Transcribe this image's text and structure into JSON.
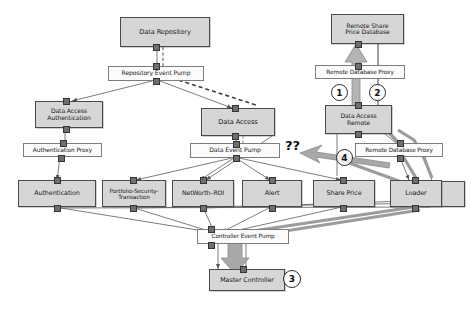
{
  "diagram": {
    "background_color": "#ffffff",
    "shaded_fill": "#d6d6d6",
    "plain_fill": "#fbfbfb",
    "thick_arrow_color": "#9a9a9a",
    "nodes": [
      {
        "id": "data-repository",
        "label": "Data Repository",
        "style": "shaded",
        "x": 120,
        "y": 17,
        "w": 90,
        "h": 30,
        "font": 6.6
      },
      {
        "id": "repository-event-pump",
        "label": "Repository Event Pump",
        "style": "plain",
        "x": 108,
        "y": 66,
        "w": 96,
        "h": 15,
        "font": 6.1
      },
      {
        "id": "data-access-authentication",
        "label": "Data Access\nAuthentication",
        "style": "shaded",
        "x": 35,
        "y": 101,
        "w": 68,
        "h": 27,
        "font": 6.1
      },
      {
        "id": "authentication-proxy",
        "label": "Authentication Proxy",
        "style": "plain",
        "x": 23,
        "y": 143,
        "w": 79,
        "h": 14,
        "font": 5.9
      },
      {
        "id": "data-access",
        "label": "Data Access",
        "style": "shaded",
        "x": 201,
        "y": 108,
        "w": 74,
        "h": 28,
        "font": 6.6
      },
      {
        "id": "data-event-pump",
        "label": "Data Event Pump",
        "style": "plain",
        "x": 190,
        "y": 143,
        "w": 90,
        "h": 15,
        "font": 6.1
      },
      {
        "id": "remote-share-price-database",
        "label": "Remote Share\nPrice Database",
        "style": "shaded",
        "x": 331,
        "y": 14,
        "w": 73,
        "h": 30,
        "font": 6.1
      },
      {
        "id": "remote-database-proxy-top",
        "label": "Remote Database Proxy",
        "style": "plain",
        "x": 315,
        "y": 65,
        "w": 90,
        "h": 14,
        "font": 5.8
      },
      {
        "id": "data-access-remote",
        "label": "Data Access\nRemote",
        "style": "shaded",
        "x": 325,
        "y": 105,
        "w": 67,
        "h": 29,
        "font": 6.1
      },
      {
        "id": "remote-database-proxy-bottom",
        "label": "Remote Database Proxy",
        "style": "plain",
        "x": 355,
        "y": 143,
        "w": 88,
        "h": 14,
        "font": 5.8
      },
      {
        "id": "authentication",
        "label": "Authentication",
        "style": "shaded",
        "x": 18,
        "y": 180,
        "w": 78,
        "h": 27,
        "font": 6.4
      },
      {
        "id": "portfolio-security-transaction",
        "label": "Portfolio-Security-\nTransaction",
        "style": "shaded",
        "x": 102,
        "y": 180,
        "w": 64,
        "h": 27,
        "font": 5.7
      },
      {
        "id": "networth-roi",
        "label": "NetWorth–ROI",
        "style": "shaded",
        "x": 172,
        "y": 180,
        "w": 62,
        "h": 27,
        "font": 6.2
      },
      {
        "id": "alert",
        "label": "Alert",
        "style": "shaded",
        "x": 242,
        "y": 180,
        "w": 60,
        "h": 27,
        "font": 6.4
      },
      {
        "id": "share-price",
        "label": "Share Price",
        "style": "shaded",
        "x": 313,
        "y": 180,
        "w": 62,
        "h": 27,
        "font": 6.4
      },
      {
        "id": "loader",
        "label": "Loader",
        "style": "shaded",
        "x": 390,
        "y": 180,
        "w": 52,
        "h": 27,
        "font": 6.4
      },
      {
        "id": "loader-back",
        "label": "",
        "style": "shaded",
        "x": 420,
        "y": 181,
        "w": 45,
        "h": 26,
        "font": 6.4
      },
      {
        "id": "controller-event-pump",
        "label": "Controller Event Pump",
        "style": "plain",
        "x": 197,
        "y": 229,
        "w": 92,
        "h": 15,
        "font": 5.8
      },
      {
        "id": "master-controller",
        "label": "Master Controller",
        "style": "shaded",
        "x": 209,
        "y": 269,
        "w": 76,
        "h": 22,
        "font": 6.4
      }
    ],
    "annotations": {
      "question_marks": {
        "text": "??",
        "x": 285,
        "y": 138,
        "font": 13
      },
      "numbered_circles": [
        {
          "number": "1",
          "x": 331,
          "y": 84,
          "d": 17
        },
        {
          "number": "2",
          "x": 369,
          "y": 84,
          "d": 17
        },
        {
          "number": "3",
          "x": 283,
          "y": 270,
          "d": 18
        },
        {
          "number": "4",
          "x": 336,
          "y": 149,
          "d": 17
        }
      ]
    }
  }
}
